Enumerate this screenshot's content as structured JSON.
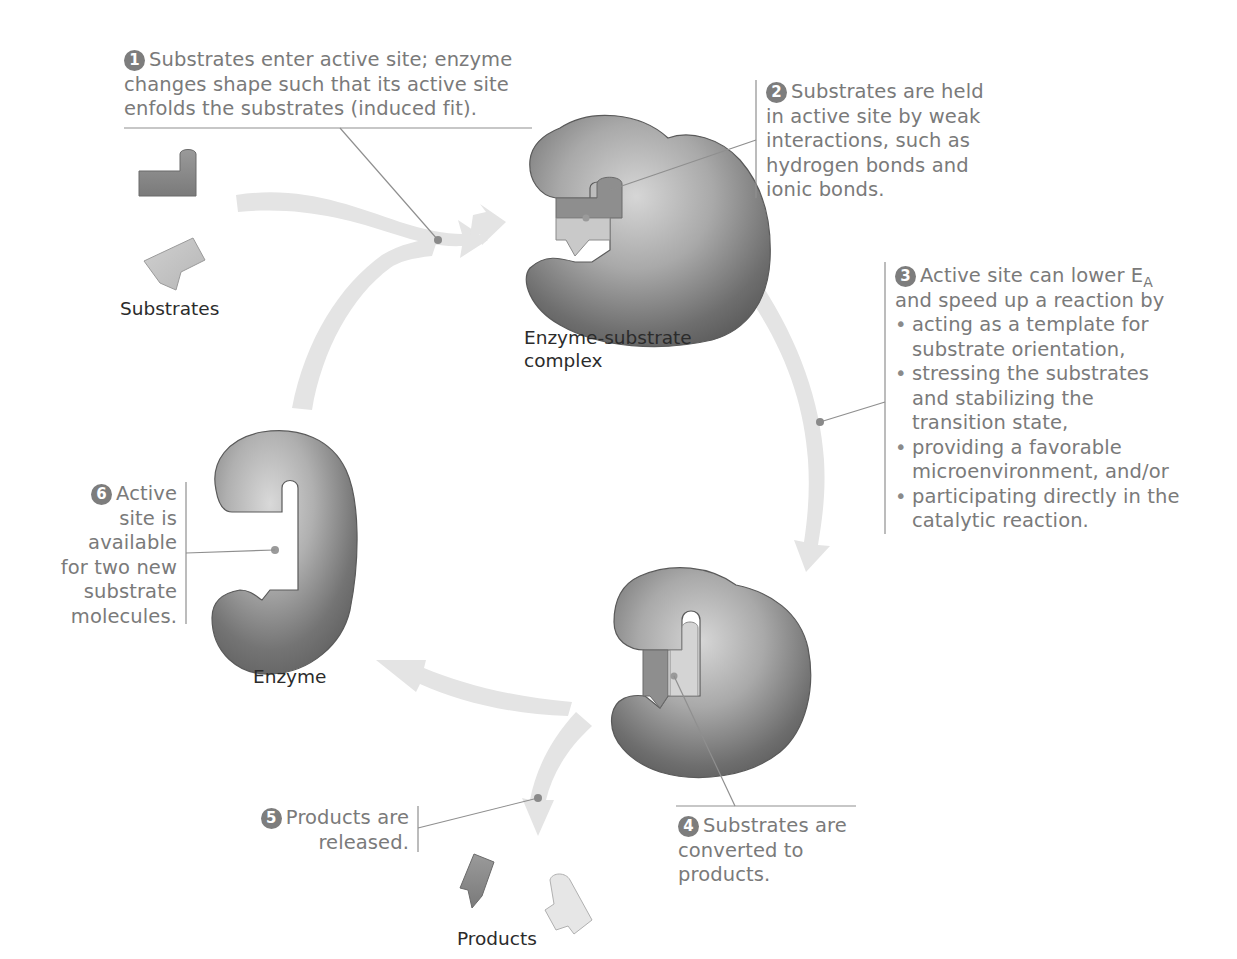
{
  "figure": {
    "colors": {
      "callout_text": "#7a7a7a",
      "label_text": "#2b2b2b",
      "step_badge": "#7d7d7d",
      "arrow_fill": "#e3e3e3",
      "enzyme_dark": "#6f6f6f",
      "enzyme_light": "#c9c9c9",
      "substrate_dark": "#8a8a8a",
      "substrate_light": "#c4c4c4",
      "leader_line": "#8f8f8f"
    }
  },
  "labels": {
    "substrates": "Substrates",
    "complex_line1": "Enzyme-substrate",
    "complex_line2": "complex",
    "enzyme": "Enzyme",
    "products": "Products"
  },
  "steps": [
    {
      "number": "1",
      "lines": [
        "Substrates enter active site; enzyme",
        "changes shape such that its active site",
        "enfolds the substrates (induced fit)."
      ]
    },
    {
      "number": "2",
      "lines": [
        "Substrates are held",
        "in active site by weak",
        "interactions, such as",
        "hydrogen bonds and",
        "ionic bonds."
      ]
    },
    {
      "number": "3",
      "intro_line1": "Active site can lower E",
      "intro_subscript": "A",
      "intro_line2": "and speed up a reaction by",
      "bullets": [
        {
          "line1": "acting as a template for",
          "line2": "substrate orientation,"
        },
        {
          "line1": "stressing the substrates",
          "line2": "and stabilizing the",
          "line3": "transition state,"
        },
        {
          "line1": "providing a favorable",
          "line2": "microenvironment, and/or"
        },
        {
          "line1": "participating directly in the",
          "line2": "catalytic reaction."
        }
      ],
      "bullet_glyph": "•"
    },
    {
      "number": "4",
      "lines": [
        "Substrates are",
        "converted to",
        "products."
      ]
    },
    {
      "number": "5",
      "lines": [
        "Products are",
        "released."
      ]
    },
    {
      "number": "6",
      "lines": [
        "Active",
        "site is",
        "available",
        "for two new",
        "substrate",
        "molecules."
      ]
    }
  ]
}
